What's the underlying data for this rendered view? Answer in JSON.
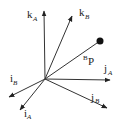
{
  "diagram": {
    "title": "",
    "colors": {
      "stroke": "#333333",
      "text": "#222222",
      "point": "#111111",
      "background": "#ffffff"
    },
    "frame_A": {
      "name": "A",
      "axes": [
        {
          "id": "i_A",
          "base": "i",
          "sub": "A"
        },
        {
          "id": "j_A",
          "base": "j",
          "sub": "A"
        },
        {
          "id": "k_A",
          "base": "k",
          "sub": "A"
        }
      ]
    },
    "frame_B": {
      "name": "B",
      "axes": [
        {
          "id": "i_B",
          "base": "i",
          "sub": "B"
        },
        {
          "id": "j_B",
          "base": "j",
          "sub": "B"
        },
        {
          "id": "k_B",
          "base": "k",
          "sub": "B"
        }
      ]
    },
    "vector_P": {
      "sup": "B",
      "base": "P",
      "description": "position vector of point P expressed in frame B"
    }
  }
}
